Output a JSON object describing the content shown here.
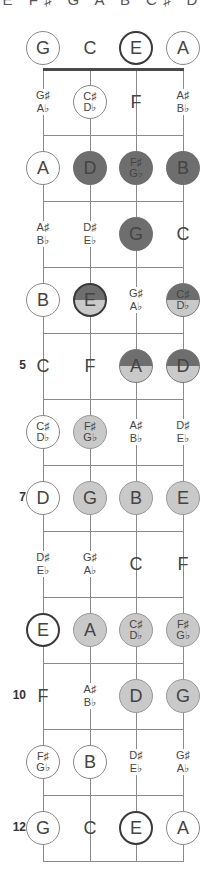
{
  "header": {
    "scale_label": "E F♯ G A B C♯ D"
  },
  "layout": {
    "string_x": [
      43,
      90,
      136,
      183
    ],
    "open_row_y": 48,
    "nut_y": 69,
    "fret_spacing": 66,
    "fret_count": 12,
    "colors": {
      "dark": "#6e6e6e",
      "light": "#c9c9c9",
      "outline": "#888888",
      "root_ring": "#3a3a3a"
    }
  },
  "strings": [
    "G",
    "C",
    "E",
    "A"
  ],
  "fret_markers": [
    {
      "fret": 5,
      "label": "5"
    },
    {
      "fret": 7,
      "label": "7"
    },
    {
      "fret": 10,
      "label": "10"
    },
    {
      "fret": 12,
      "label": "12"
    }
  ],
  "rows": [
    {
      "fret": 0,
      "cells": [
        {
          "note": "G",
          "style": "ring"
        },
        {
          "note": "C",
          "style": "plain"
        },
        {
          "note": "E",
          "style": "bold"
        },
        {
          "note": "A",
          "style": "ring"
        }
      ]
    },
    {
      "fret": 1,
      "cells": [
        {
          "note": "G♯|A♭",
          "style": "plain"
        },
        {
          "note": "C♯|D♭",
          "style": "ring"
        },
        {
          "note": "F",
          "style": "plain"
        },
        {
          "note": "A♯|B♭",
          "style": "plain"
        }
      ]
    },
    {
      "fret": 2,
      "cells": [
        {
          "note": "A",
          "style": "ring"
        },
        {
          "note": "D",
          "style": "dark"
        },
        {
          "note": "F♯|G♭",
          "style": "dark"
        },
        {
          "note": "B",
          "style": "dark"
        }
      ]
    },
    {
      "fret": 3,
      "cells": [
        {
          "note": "A♯|B♭",
          "style": "plain"
        },
        {
          "note": "D♯|E♭",
          "style": "plain"
        },
        {
          "note": "G",
          "style": "dark"
        },
        {
          "note": "C",
          "style": "plain"
        }
      ]
    },
    {
      "fret": 4,
      "cells": [
        {
          "note": "B",
          "style": "ring"
        },
        {
          "note": "E",
          "style": "half bold"
        },
        {
          "note": "G♯|A♭",
          "style": "plain"
        },
        {
          "note": "C♯|D♭",
          "style": "half"
        }
      ]
    },
    {
      "fret": 5,
      "cells": [
        {
          "note": "C",
          "style": "plain"
        },
        {
          "note": "F",
          "style": "plain"
        },
        {
          "note": "A",
          "style": "half"
        },
        {
          "note": "D",
          "style": "half"
        }
      ]
    },
    {
      "fret": 6,
      "cells": [
        {
          "note": "C♯|D♭",
          "style": "ring"
        },
        {
          "note": "F♯|G♭",
          "style": "light"
        },
        {
          "note": "A♯|B♭",
          "style": "plain"
        },
        {
          "note": "D♯|E♭",
          "style": "plain"
        }
      ]
    },
    {
      "fret": 7,
      "cells": [
        {
          "note": "D",
          "style": "ring"
        },
        {
          "note": "G",
          "style": "light"
        },
        {
          "note": "B",
          "style": "light"
        },
        {
          "note": "E",
          "style": "light bold"
        }
      ]
    },
    {
      "fret": 8,
      "cells": [
        {
          "note": "D♯|E♭",
          "style": "plain"
        },
        {
          "note": "G♯|A♭",
          "style": "plain"
        },
        {
          "note": "C",
          "style": "plain"
        },
        {
          "note": "F",
          "style": "plain"
        }
      ]
    },
    {
      "fret": 9,
      "cells": [
        {
          "note": "E",
          "style": "bold"
        },
        {
          "note": "A",
          "style": "light"
        },
        {
          "note": "C♯|D♭",
          "style": "light"
        },
        {
          "note": "F♯|G♭",
          "style": "light"
        }
      ]
    },
    {
      "fret": 10,
      "cells": [
        {
          "note": "F",
          "style": "plain"
        },
        {
          "note": "A♯|B♭",
          "style": "plain"
        },
        {
          "note": "D",
          "style": "light"
        },
        {
          "note": "G",
          "style": "light"
        }
      ]
    },
    {
      "fret": 11,
      "cells": [
        {
          "note": "F♯|G♭",
          "style": "ring"
        },
        {
          "note": "B",
          "style": "ring"
        },
        {
          "note": "D♯|E♭",
          "style": "plain"
        },
        {
          "note": "G♯|A♭",
          "style": "plain"
        }
      ]
    },
    {
      "fret": 12,
      "cells": [
        {
          "note": "G",
          "style": "ring"
        },
        {
          "note": "C",
          "style": "plain"
        },
        {
          "note": "E",
          "style": "bold"
        },
        {
          "note": "A",
          "style": "ring"
        }
      ]
    }
  ]
}
